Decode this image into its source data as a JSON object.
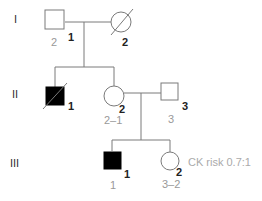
{
  "diagram": {
    "type": "pedigree",
    "colors": {
      "line": "#7a7a7a",
      "affected": "#000000",
      "unaffected": "#ffffff",
      "sub_label": "#999999"
    },
    "generations": [
      {
        "label": "I"
      },
      {
        "label": "II"
      },
      {
        "label": "III"
      }
    ],
    "individuals": {
      "I1": {
        "id": "1",
        "sub": "2",
        "sex": "male",
        "affected": false,
        "deceased": false
      },
      "I2": {
        "id": "2",
        "sex": "female",
        "affected": false,
        "deceased": true
      },
      "II1": {
        "id": "1",
        "sex": "male",
        "affected": true,
        "deceased": true
      },
      "II2": {
        "id": "2",
        "sub": "2–1",
        "sex": "female",
        "affected": false,
        "deceased": false
      },
      "II3": {
        "id": "3",
        "sub": "3",
        "sex": "male",
        "affected": false,
        "deceased": false
      },
      "III1": {
        "id": "1",
        "sub": "1",
        "sex": "male",
        "affected": true,
        "deceased": false
      },
      "III2": {
        "id": "2",
        "sub": "3–2",
        "sex": "female",
        "affected": false,
        "deceased": false,
        "note": "CK risk 0.7:1"
      }
    }
  }
}
